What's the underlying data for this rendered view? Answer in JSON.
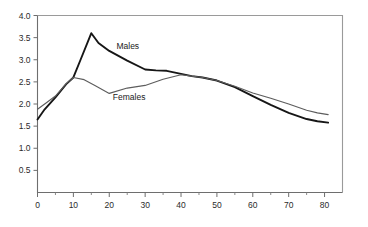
{
  "chart_data": {
    "type": "line",
    "title": "",
    "subtitle": "",
    "xlabel": "",
    "ylabel": "",
    "xlim": [
      0,
      85
    ],
    "ylim": [
      0,
      4.0
    ],
    "grid": false,
    "legend_position": "inline-annotation",
    "x_ticks": [
      0,
      10,
      20,
      30,
      40,
      50,
      60,
      70,
      80
    ],
    "x_tick_labels": [
      "0",
      "10",
      "20",
      "30",
      "40",
      "50",
      "60",
      "70",
      "80"
    ],
    "x_minor_ticks": [
      5,
      15,
      25,
      35,
      45,
      55,
      65,
      75
    ],
    "y_ticks": [
      0.5,
      1.0,
      1.5,
      2.0,
      2.5,
      3.0,
      3.5,
      4.0
    ],
    "y_tick_labels": [
      "0.5",
      "1.0",
      "1.5",
      "2.0",
      "2.5",
      "3.0",
      "3.5",
      "4.0"
    ],
    "series": [
      {
        "name": "Males",
        "color": "#161616",
        "linewidth": 1.9,
        "annotation": "Males",
        "annotation_x": 22,
        "annotation_y": 3.25,
        "x": [
          0,
          2,
          5,
          8,
          10,
          12,
          15,
          17,
          20,
          25,
          30,
          33,
          36,
          40,
          43,
          46,
          50,
          55,
          60,
          65,
          70,
          75,
          78,
          81
        ],
        "y": [
          1.65,
          1.88,
          2.15,
          2.45,
          2.6,
          3.0,
          3.6,
          3.38,
          3.2,
          2.98,
          2.78,
          2.76,
          2.75,
          2.68,
          2.63,
          2.6,
          2.53,
          2.38,
          2.18,
          1.98,
          1.8,
          1.66,
          1.61,
          1.58
        ]
      },
      {
        "name": "Females",
        "color": "#5d5d5d",
        "linewidth": 1.15,
        "annotation": "Females",
        "annotation_x": 21,
        "annotation_y": 2.08,
        "x": [
          0,
          2,
          5,
          8,
          10,
          13,
          16,
          20,
          25,
          30,
          35,
          40,
          43,
          46,
          50,
          55,
          60,
          65,
          70,
          75,
          78,
          81
        ],
        "y": [
          1.88,
          2.0,
          2.18,
          2.46,
          2.6,
          2.55,
          2.42,
          2.24,
          2.36,
          2.42,
          2.56,
          2.66,
          2.63,
          2.6,
          2.53,
          2.4,
          2.25,
          2.13,
          2.0,
          1.86,
          1.8,
          1.76
        ]
      }
    ]
  },
  "axes": {
    "y_axis_name": "value-axis",
    "x_axis_name": "age-axis"
  }
}
